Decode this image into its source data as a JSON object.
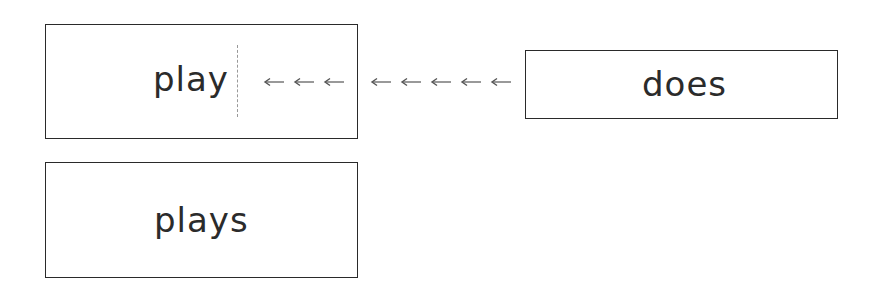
{
  "diagram": {
    "boxes": [
      {
        "id": "box-play",
        "label": "play"
      },
      {
        "id": "box-does",
        "label": "does"
      },
      {
        "id": "box-plays",
        "label": "plays"
      }
    ],
    "arrows": {
      "inside_count": 3,
      "outside_count": 5,
      "direction": "left",
      "color": "#555555"
    },
    "divider": {
      "style": "dashed",
      "color": "#999999"
    }
  }
}
